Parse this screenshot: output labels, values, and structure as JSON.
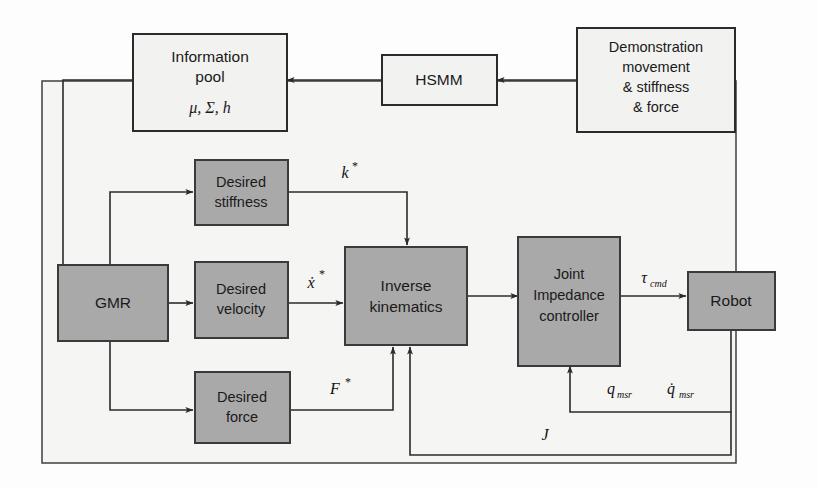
{
  "figure": {
    "type": "block-diagram",
    "background_color": "#fdfdfd",
    "frame_color": "#f5f5f3",
    "gray_block_color": "#a9a9a9",
    "white_block_color": "#f2f2f0",
    "line_color": "#2b2b2b"
  },
  "blocks": {
    "information_pool": {
      "line1": "Information",
      "line2": "pool",
      "symbols": "μ, Σ, h",
      "style": "white"
    },
    "hsmm": {
      "label": "HSMM",
      "style": "white"
    },
    "demonstration": {
      "line1": "Demonstration",
      "line2": "movement",
      "line3": "& stiffness",
      "line4": "&  force",
      "style": "white"
    },
    "gmr": {
      "label": "GMR",
      "style": "gray"
    },
    "desired_stiffness": {
      "line1": "Desired",
      "line2": "stiffness",
      "style": "gray"
    },
    "desired_velocity": {
      "line1": "Desired",
      "line2": "velocity",
      "style": "gray"
    },
    "desired_force": {
      "line1": "Desired",
      "line2": "force",
      "style": "gray"
    },
    "inverse_kinematics": {
      "line1": "Inverse",
      "line2": "kinematics",
      "style": "gray"
    },
    "joint_impedance_controller": {
      "line1": "Joint",
      "line2": "Impedance",
      "line3": "controller",
      "style": "gray"
    },
    "robot": {
      "label": "Robot",
      "style": "gray"
    }
  },
  "signals": {
    "stiffness_cmd": {
      "base": "k",
      "star": "*"
    },
    "velocity_cmd": {
      "base": "ẋ",
      "star": "*"
    },
    "force_cmd": {
      "base": "F",
      "star": "*"
    },
    "torque_cmd": {
      "base": "τ",
      "sub": "cmd"
    },
    "joint_position": {
      "base": "q",
      "sub": "msr"
    },
    "joint_velocity": {
      "base": "q̇",
      "sub": "msr"
    },
    "jacobian": {
      "base": "J"
    }
  },
  "edges": [
    {
      "from": "demonstration",
      "to": "hsmm",
      "label": ""
    },
    {
      "from": "hsmm",
      "to": "information_pool",
      "label": ""
    },
    {
      "from": "information_pool",
      "to": "gmr",
      "label": ""
    },
    {
      "from": "gmr",
      "to": "desired_stiffness",
      "label": ""
    },
    {
      "from": "gmr",
      "to": "desired_velocity",
      "label": ""
    },
    {
      "from": "gmr",
      "to": "desired_force",
      "label": ""
    },
    {
      "from": "desired_stiffness",
      "to": "inverse_kinematics",
      "label": "k*"
    },
    {
      "from": "desired_velocity",
      "to": "inverse_kinematics",
      "label": "ẋ*"
    },
    {
      "from": "desired_force",
      "to": "inverse_kinematics",
      "label": "F*"
    },
    {
      "from": "inverse_kinematics",
      "to": "joint_impedance_controller",
      "label": ""
    },
    {
      "from": "joint_impedance_controller",
      "to": "robot",
      "label": "τcmd"
    },
    {
      "from": "robot",
      "to": "joint_impedance_controller",
      "label": "qmsr q̇msr"
    },
    {
      "from": "robot",
      "to": "inverse_kinematics",
      "label": "J"
    }
  ]
}
